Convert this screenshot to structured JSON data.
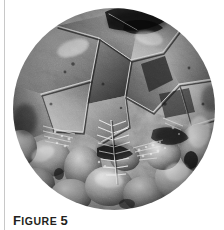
{
  "page": {
    "background_color": "#ffffff",
    "margin_rule_color": "#c8c8c8"
  },
  "figure": {
    "caption_lead": "F",
    "caption_rest": "IGURE",
    "caption_number": "5",
    "caption_full": "FIGURE 5",
    "caption_color": "#231f20",
    "image_shape": "circle",
    "image_kind": "grayscale-micrograph",
    "image_description": "Circular grayscale scanning-electron micrograph of a fractured crystalline surface showing interlocking polygonal grains with dark grain boundaries, rounded nodular aggregates in the lower half, and a dendritic fern-like crystal growth near the center.",
    "palette": {
      "darkest": "#1a1a1a",
      "dark": "#3d3d3d",
      "mid": "#6e6e6e",
      "light": "#a8a8a8",
      "lightest": "#e2e2e2"
    }
  }
}
